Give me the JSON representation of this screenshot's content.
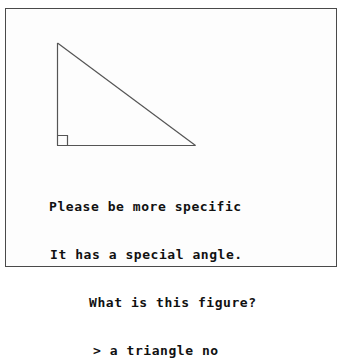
{
  "frame": {
    "border_color": "#4a4a4a",
    "background_color": "#fdfdfd"
  },
  "figure": {
    "name": "right-triangle",
    "shape": "right triangle",
    "stroke_color": "#555555",
    "apex": {
      "x": 56,
      "y": 42
    },
    "bottom_left": {
      "x": 56,
      "y": 144
    },
    "bottom_right": {
      "x": 194,
      "y": 144
    },
    "right_angle_marker": {
      "present": true,
      "size": 10,
      "corner": "bottom-left"
    }
  },
  "transcript": {
    "text_color": "#111111",
    "lines": [
      {
        "id": "line-1",
        "text": "Please be more specific",
        "speaker": "system"
      },
      {
        "id": "line-2",
        "text": "It has a special angle.",
        "speaker": "system"
      },
      {
        "id": "line-3",
        "text": "What is this figure?",
        "speaker": "system"
      },
      {
        "id": "line-4",
        "text": "> a triangle no",
        "speaker": "user"
      }
    ]
  }
}
